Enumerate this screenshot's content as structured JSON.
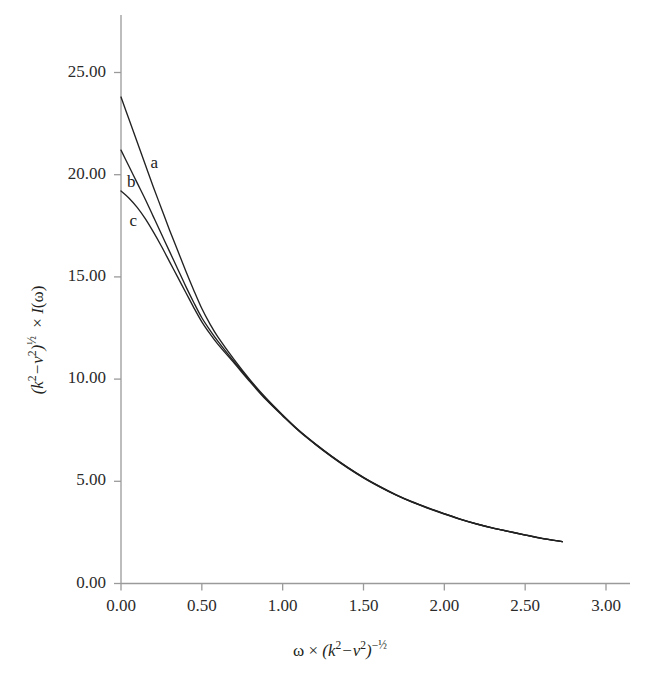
{
  "figure": {
    "background_color": "#ffffff",
    "axis_color": "#9a9a9a",
    "curve_color": "#222222",
    "text_color": "#2b2b2b"
  },
  "chart_data": {
    "type": "line",
    "title": "",
    "subtitle": "",
    "xlabel": "ω × (k²−ν²)⁻½",
    "ylabel": "(k²−ν²)½ × I(ω)",
    "xlim": [
      0.0,
      3.0
    ],
    "ylim": [
      0.0,
      25.0
    ],
    "grid": false,
    "legend_position": "inline-curve-labels",
    "xticks": [
      0.0,
      0.5,
      1.0,
      1.5,
      2.0,
      2.5,
      3.0
    ],
    "xtick_labels": [
      "0.00",
      "0.50",
      "1.00",
      "1.50",
      "2.00",
      "2.50",
      "3.00"
    ],
    "yticks": [
      0.0,
      5.0,
      10.0,
      15.0,
      20.0,
      25.0
    ],
    "ytick_labels": [
      "0.00",
      "5.00",
      "10.00",
      "15.00",
      "20.00",
      "25.00"
    ],
    "annotations": [
      {
        "text": "a",
        "x": 0.17,
        "y": 20.5
      },
      {
        "text": "b",
        "x": 0.025,
        "y": 19.6
      },
      {
        "text": "c",
        "x": 0.04,
        "y": 17.7
      }
    ],
    "series": [
      {
        "name": "a",
        "label": "a",
        "x": [
          0.0,
          0.05,
          0.1,
          0.15,
          0.2,
          0.25,
          0.3,
          0.35,
          0.4,
          0.45,
          0.5,
          0.55,
          0.6,
          0.7,
          0.8,
          0.9,
          1.0,
          1.1,
          1.2,
          1.3,
          1.4,
          1.5,
          1.6,
          1.7,
          1.8,
          1.9,
          2.0,
          2.1,
          2.2,
          2.3,
          2.4,
          2.5,
          2.6,
          2.73
        ],
        "values": [
          23.8,
          22.7,
          21.6,
          20.5,
          19.4,
          18.35,
          17.3,
          16.3,
          15.3,
          14.35,
          13.45,
          12.7,
          12.05,
          10.95,
          9.95,
          9.05,
          8.25,
          7.5,
          6.85,
          6.25,
          5.7,
          5.2,
          4.75,
          4.35,
          4.0,
          3.7,
          3.42,
          3.15,
          2.92,
          2.72,
          2.55,
          2.38,
          2.22,
          2.05
        ]
      },
      {
        "name": "b",
        "label": "b",
        "x": [
          0.0,
          0.05,
          0.1,
          0.15,
          0.2,
          0.25,
          0.3,
          0.35,
          0.4,
          0.45,
          0.5,
          0.55,
          0.6,
          0.7,
          0.8,
          0.9,
          1.0,
          1.1,
          1.2,
          1.3,
          1.4,
          1.5,
          1.6,
          1.7,
          1.8,
          1.9,
          2.0,
          2.1,
          2.2,
          2.3,
          2.4,
          2.5,
          2.6,
          2.73
        ],
        "values": [
          21.2,
          20.4,
          19.6,
          18.8,
          17.95,
          17.1,
          16.25,
          15.4,
          14.55,
          13.75,
          13.0,
          12.4,
          11.85,
          10.85,
          9.9,
          9.0,
          8.22,
          7.48,
          6.83,
          6.23,
          5.68,
          5.18,
          4.74,
          4.34,
          3.99,
          3.69,
          3.41,
          3.14,
          2.91,
          2.71,
          2.54,
          2.37,
          2.21,
          2.05
        ]
      },
      {
        "name": "c",
        "label": "c",
        "x": [
          0.0,
          0.05,
          0.1,
          0.15,
          0.2,
          0.25,
          0.3,
          0.35,
          0.4,
          0.45,
          0.5,
          0.55,
          0.6,
          0.7,
          0.8,
          0.9,
          1.0,
          1.1,
          1.2,
          1.3,
          1.4,
          1.5,
          1.6,
          1.7,
          1.8,
          1.9,
          2.0,
          2.1,
          2.2,
          2.3,
          2.4,
          2.5,
          2.6,
          2.73
        ],
        "values": [
          19.2,
          18.85,
          18.4,
          17.85,
          17.2,
          16.5,
          15.75,
          15.0,
          14.25,
          13.5,
          12.8,
          12.22,
          11.7,
          10.78,
          9.85,
          8.97,
          8.2,
          7.46,
          6.82,
          6.22,
          5.67,
          5.17,
          4.73,
          4.33,
          3.98,
          3.68,
          3.4,
          3.14,
          2.91,
          2.71,
          2.54,
          2.37,
          2.21,
          2.05
        ]
      }
    ]
  }
}
